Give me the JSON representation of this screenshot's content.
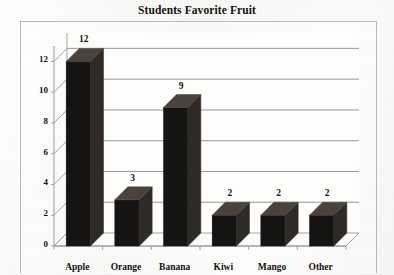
{
  "chart_data": {
    "type": "bar",
    "title": "Students Favorite Fruit",
    "xlabel": "",
    "ylabel": "",
    "categories": [
      "Apple",
      "Orange",
      "Banana",
      "Kiwi",
      "Mango",
      "Other"
    ],
    "values": [
      12,
      3,
      9,
      2,
      2,
      2
    ],
    "data_labels": [
      "12",
      "3",
      "9",
      "2",
      "2",
      "2"
    ],
    "ylim": [
      0,
      13
    ],
    "ytick_labels": [
      "0",
      "2",
      "4",
      "6",
      "8",
      "10",
      "12"
    ],
    "ytick_values": [
      0,
      2,
      4,
      6,
      8,
      10,
      12
    ],
    "grid": true,
    "legend": false,
    "legend_position": "none",
    "style": "3d-column",
    "colors": {
      "bar_front": "#161412",
      "bar_side": "#2e2a26",
      "bar_top": "#49433c",
      "gridline": "#8d8d8d",
      "axis": "#9a9a9a",
      "frame": "#b9b9b9",
      "text": "#14120f",
      "background": "#fbfbfa"
    }
  }
}
